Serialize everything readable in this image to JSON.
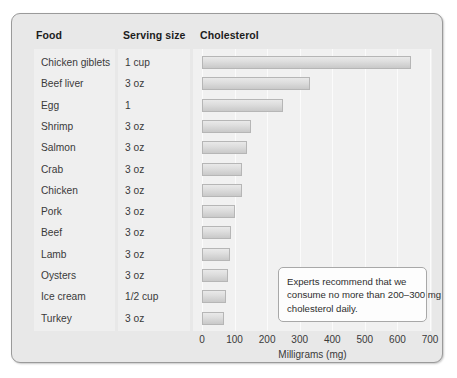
{
  "panel": {
    "headers": {
      "food": "Food",
      "serving": "Serving size",
      "cholesterol": "Cholesterol"
    }
  },
  "annotation": {
    "line1": "Experts recommend that we",
    "line2": "consume no more than 200–300 mg",
    "line3": "cholesterol daily."
  },
  "colors": {
    "panel_background": "#e8e8e8",
    "subpanel_background": "#efefef",
    "plot_background": "#f1f1f1",
    "bar_fill": "#d8d8d8",
    "bar_border": "#b6b6b6",
    "text": "#3a3a3a",
    "panel_border": "#9a9a9a"
  },
  "chart_data": {
    "type": "bar",
    "orientation": "horizontal",
    "title": "Cholesterol",
    "xlabel": "Milligrams (mg)",
    "ylabel": "",
    "xlim": [
      0,
      700
    ],
    "xticks": [
      0,
      100,
      200,
      300,
      400,
      500,
      600,
      700
    ],
    "tick_labels": [
      "0",
      "100",
      "200",
      "300",
      "400",
      "500",
      "600",
      "700"
    ],
    "grid": true,
    "legend": false,
    "categories": [
      "Chicken giblets",
      "Beef liver",
      "Egg",
      "Shrimp",
      "Salmon",
      "Crab",
      "Chicken",
      "Pork",
      "Beef",
      "Lamb",
      "Oysters",
      "Ice cream",
      "Turkey"
    ],
    "serving_sizes": [
      "1 cup",
      "3 oz",
      "1",
      "3 oz",
      "3 oz",
      "3 oz",
      "3 oz",
      "3 oz",
      "3 oz",
      "3 oz",
      "3 oz",
      "1/2 cup",
      "3 oz"
    ],
    "values": [
      641,
      331,
      250,
      150,
      138,
      124,
      122,
      100,
      89,
      85,
      80,
      75,
      68
    ],
    "units": "mg"
  }
}
